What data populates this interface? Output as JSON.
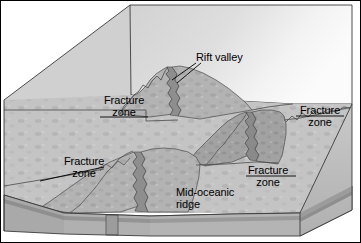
{
  "figure": {
    "type": "geologic-block-diagram",
    "background_color": "#ffffff",
    "border_color": "#000000",
    "width": 361,
    "height": 243
  },
  "palette": {
    "seafloor_plain": "#c6c6c6",
    "block_back_face": "#d6d6d6",
    "block_back_face_light": "#f2f2f2",
    "ridge_flank": "#b4b4b4",
    "ridge_crest": "#9e9e9e",
    "rift_shadow": "#8c8c8c",
    "crust_layer_top": "#a8a8a8",
    "crust_layer_mid": "#9a9a9a",
    "crust_layer_bottom": "#b0b0b0",
    "side_face": "#bdbdbd",
    "outline": "#3a3a3a",
    "label_text": "#000000",
    "leader_line": "#000000"
  },
  "labels": {
    "rift_valley": {
      "lines": [
        "Rift valley"
      ],
      "leader": "diagonal-down-left"
    },
    "fracture_zone_upper_left": {
      "lines": [
        "Fracture",
        "zone"
      ],
      "leader": "horizontal-right"
    },
    "fracture_zone_right": {
      "lines": [
        "Fracture",
        "zone"
      ],
      "leader": "horizontal-left"
    },
    "fracture_zone_lower_left": {
      "lines": [
        "Fracture",
        "zone"
      ],
      "leader": "diagonal-down-left"
    },
    "fracture_zone_lower_right": {
      "lines": [
        "Fracture",
        "zone"
      ],
      "leader": "horizontal-left"
    },
    "mid_oceanic_ridge": {
      "lines": [
        "Mid-oceanic",
        "ridge"
      ],
      "leader": "none"
    }
  },
  "features": {
    "ridge_segments": 3,
    "fracture_zones": 4,
    "rift_valleys": 3,
    "crust_layers": 3
  }
}
